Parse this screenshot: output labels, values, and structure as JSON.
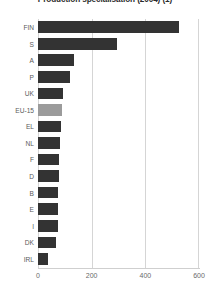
{
  "chart_data": {
    "type": "bar",
    "orientation": "horizontal",
    "title": "Production specialisation (2004) (1)",
    "xlabel": "",
    "ylabel": "",
    "xlim": [
      0,
      600
    ],
    "xticks": [
      0,
      200,
      400,
      600
    ],
    "xtick_labels": [
      "0",
      "200",
      "400",
      "600"
    ],
    "grid": true,
    "legend": "none",
    "categories": [
      "FIN",
      "S",
      "A",
      "P",
      "UK",
      "EU-15",
      "EL",
      "NL",
      "F",
      "D",
      "B",
      "E",
      "I",
      "DK",
      "IRL"
    ],
    "values": [
      525,
      295,
      134,
      119,
      93,
      89,
      86,
      82,
      78,
      78,
      75,
      74,
      73,
      67,
      38
    ],
    "highlight_category": "EU-15",
    "colors": {
      "bar": "#333333",
      "bar_highlight": "#9b9b9b",
      "grid": "#d5d5d5",
      "axis": "#cfcfcf",
      "text": "#5a5a5a",
      "title": "#2b2b2b",
      "background": "#ffffff"
    }
  }
}
